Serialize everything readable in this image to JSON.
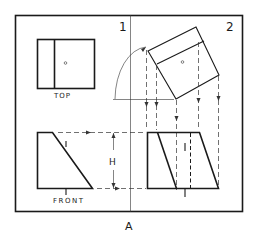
{
  "figure": {
    "label": "A",
    "frame_labels": {
      "left": "1",
      "right": "2"
    },
    "views": {
      "top": {
        "label": "TOP"
      },
      "front": {
        "label": "FRONT"
      },
      "auxiliary_top": {
        "label": ""
      },
      "auxiliary_front": {
        "label": ""
      }
    },
    "dimension": {
      "label": "H"
    },
    "marks": {
      "edge_mark": "1"
    }
  },
  "colors": {
    "line": "#1a1a1a",
    "background": "#ffffff"
  }
}
